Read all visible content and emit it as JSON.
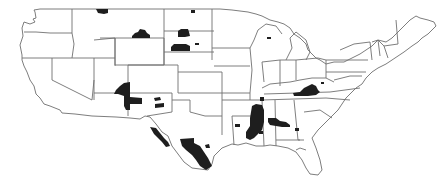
{
  "map": {
    "title": "Contiguous United States county map",
    "description": "Outline map of the contiguous United States with state borders; selected counties shaded black",
    "colors": {
      "background": "#ffffff",
      "state_fill": "#ffffff",
      "state_border": "#6e6e6e",
      "highlight": "#1e1e1e"
    },
    "highlighted_regions": [
      {
        "state": "Montana",
        "location": "northern border"
      },
      {
        "state": "Montana",
        "location": "central-east"
      },
      {
        "state": "North Dakota",
        "location": "northern border"
      },
      {
        "state": "North Dakota",
        "location": "central"
      },
      {
        "state": "South Dakota",
        "location": "north-central"
      },
      {
        "state": "Wisconsin",
        "location": "north"
      },
      {
        "state": "Utah",
        "location": "southeast"
      },
      {
        "state": "Arizona",
        "location": "northeast"
      },
      {
        "state": "New Mexico",
        "location": "central"
      },
      {
        "state": "Texas",
        "location": "Rio Grande border"
      },
      {
        "state": "Texas",
        "location": "south"
      },
      {
        "state": "Louisiana",
        "location": "north-east"
      },
      {
        "state": "Mississippi",
        "location": "Delta / west"
      },
      {
        "state": "Alabama",
        "location": "Black Belt"
      },
      {
        "state": "Georgia",
        "location": "southwest"
      },
      {
        "state": "Kentucky",
        "location": "southeast"
      },
      {
        "state": "West Virginia",
        "location": "south"
      }
    ]
  }
}
